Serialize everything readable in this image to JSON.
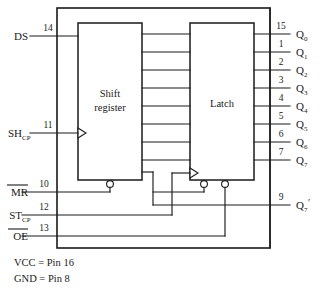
{
  "diagram": {
    "blocks": [
      {
        "id": "shift_register",
        "label_line1": "Shift",
        "label_line2": "register"
      },
      {
        "id": "latch",
        "label_line1": "Latch",
        "label_line2": ""
      }
    ],
    "inputs": [
      {
        "name": "DS",
        "pin": "14",
        "overline": false,
        "subscript": ""
      },
      {
        "name": "SH",
        "pin": "11",
        "overline": false,
        "subscript": "CP"
      },
      {
        "name": "MR",
        "pin": "10",
        "overline": true,
        "subscript": ""
      },
      {
        "name": "ST",
        "pin": "12",
        "overline": false,
        "subscript": "CP"
      },
      {
        "name": "OE",
        "pin": "13",
        "overline": true,
        "subscript": ""
      }
    ],
    "outputs": [
      {
        "name": "Q",
        "subscript": "0",
        "pin": "15",
        "prime": false
      },
      {
        "name": "Q",
        "subscript": "1",
        "pin": "1",
        "prime": false
      },
      {
        "name": "Q",
        "subscript": "2",
        "pin": "2",
        "prime": false
      },
      {
        "name": "Q",
        "subscript": "3",
        "pin": "3",
        "prime": false
      },
      {
        "name": "Q",
        "subscript": "4",
        "pin": "4",
        "prime": false
      },
      {
        "name": "Q",
        "subscript": "5",
        "pin": "5",
        "prime": false
      },
      {
        "name": "Q",
        "subscript": "6",
        "pin": "6",
        "prime": false
      },
      {
        "name": "Q",
        "subscript": "7",
        "pin": "7",
        "prime": false
      },
      {
        "name": "Q",
        "subscript": "7",
        "pin": "9",
        "prime": true
      }
    ],
    "notes": [
      "VCC = Pin 16",
      "GND = Pin 8"
    ],
    "bus_lines": 8,
    "colors": {
      "line": "#1a1a1a",
      "background": "#ffffff",
      "block_fill": "#ffffff"
    }
  }
}
